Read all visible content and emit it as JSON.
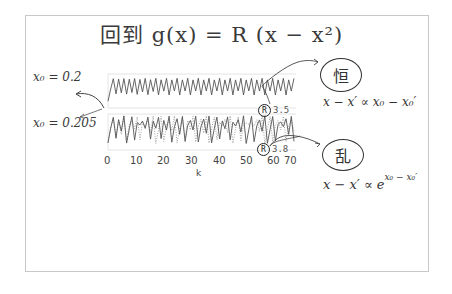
{
  "title": "回到  g(x) = R (x − x²)",
  "labels": {
    "x0_top": "x₀ = 0.2",
    "x0_bottom": "x₀ = 0.205"
  },
  "annotations": {
    "top_word": "恒",
    "bottom_word": "乱",
    "top_formula": "x − x′ ∝ x₀ − x₀′",
    "bottom_formula_base": "x − x′ ∝ e",
    "bottom_formula_exp": "x₀ − x₀′"
  },
  "plot": {
    "xlabel": "k",
    "ticks": [
      "0",
      "10",
      "20",
      "30",
      "40",
      "50",
      "60",
      "70"
    ],
    "top_tag": "3.5",
    "bottom_tag": "3.8",
    "tag_symbol": "R"
  },
  "chart_data": [
    {
      "type": "line",
      "title": "R = 3.5",
      "xlabel": "k",
      "ylabel": "",
      "xlim": [
        0,
        70
      ],
      "series": [
        {
          "name": "x0 = 0.2",
          "style": "solid",
          "pattern": "period-4 oscillation (~0.38, 0.83, 0.50, 0.87)"
        },
        {
          "name": "x0 = 0.205",
          "style": "dotted",
          "pattern": "converges onto same period-4 cycle"
        }
      ]
    },
    {
      "type": "line",
      "title": "R = 3.8",
      "xlabel": "k",
      "ylabel": "",
      "xlim": [
        0,
        70
      ],
      "series": [
        {
          "name": "x0 = 0.2",
          "style": "solid",
          "pattern": "chaotic oscillation"
        },
        {
          "name": "x0 = 0.205",
          "style": "dotted",
          "pattern": "chaotic, diverges from solid trajectory"
        }
      ]
    }
  ]
}
